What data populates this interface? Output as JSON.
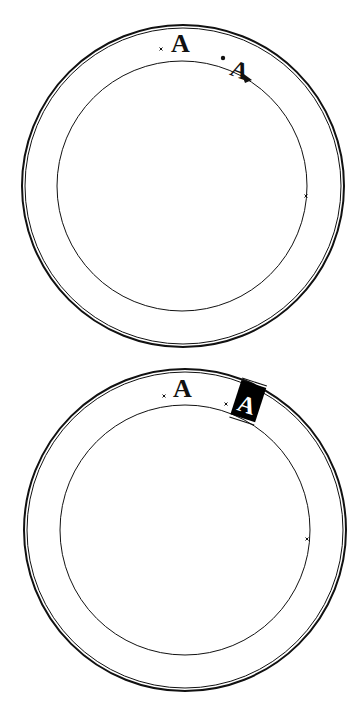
{
  "diagram": {
    "panels": [
      {
        "id": "top",
        "state": "text-on-path-editing",
        "outer_ring": {
          "cx": 183,
          "cy": 186,
          "r": 161,
          "inner_r": 158
        },
        "path_circle": {
          "cx": 182,
          "cy": 186,
          "r": 125
        },
        "glyph_upright": {
          "char": "A",
          "x": 172,
          "y": 51
        },
        "glyph_on_path": {
          "char": "A",
          "x": 238,
          "y": 69,
          "rotate": 20
        },
        "markers": [
          {
            "type": "x-marker",
            "x": 161,
            "y": 51
          },
          {
            "type": "x-marker",
            "x": 306,
            "y": 196
          }
        ],
        "handle_dot": {
          "x": 223,
          "y": 58
        },
        "anchor_triangle": {
          "x": 247,
          "y": 77
        }
      },
      {
        "id": "bottom",
        "state": "text-on-path-selected",
        "outer_ring": {
          "cx": 185,
          "cy": 176,
          "r": 161,
          "inner_r": 158
        },
        "path_circle": {
          "cx": 185,
          "cy": 176,
          "r": 125
        },
        "glyph_upright": {
          "char": "A",
          "x": 173,
          "y": 40
        },
        "glyph_on_path": {
          "char": "A",
          "x": 247,
          "y": 48,
          "rotate": 18,
          "inverted": true
        },
        "markers": [
          {
            "type": "x-marker",
            "x": 164,
            "y": 42
          },
          {
            "type": "x-marker",
            "x": 226,
            "y": 50
          },
          {
            "type": "x-marker",
            "x": 307,
            "y": 185
          }
        ]
      }
    ],
    "colors": {
      "stroke": "#111111",
      "background": "#ffffff",
      "highlight_fill": "#000000",
      "highlight_text": "#ffffff"
    }
  }
}
